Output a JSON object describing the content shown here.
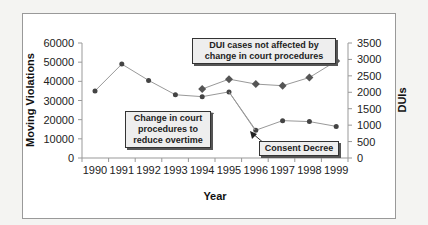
{
  "chart_data": {
    "type": "line",
    "title": "",
    "xlabel": "Year",
    "ylabel": "Moving Violations",
    "y2label": "DUIs",
    "categories": [
      "1990",
      "1991",
      "1992",
      "1993",
      "1994",
      "1995",
      "1996",
      "1997",
      "1998",
      "1999"
    ],
    "ylim": [
      0,
      60000
    ],
    "yticks": [
      "0",
      "10000",
      "20000",
      "30000",
      "40000",
      "50000",
      "60000"
    ],
    "y2lim": [
      0,
      3500
    ],
    "y2ticks": [
      "0",
      "500",
      "1000",
      "1500",
      "2000",
      "2500",
      "3000",
      "3500"
    ],
    "series": [
      {
        "name": "Moving Violations",
        "axis": "left",
        "marker": "circle",
        "values": [
          35000,
          49000,
          40500,
          33000,
          32000,
          34500,
          14500,
          19500,
          19000,
          16500
        ]
      },
      {
        "name": "DUIs",
        "axis": "right",
        "marker": "diamond",
        "values": [
          null,
          null,
          null,
          null,
          2100,
          2400,
          2250,
          2200,
          2450,
          2950
        ]
      }
    ],
    "annotations": [
      {
        "id": "dui",
        "text": "DUI cases not affected by change in court procedures"
      },
      {
        "id": "court",
        "text": "Change in court procedures to reduce overtime"
      },
      {
        "id": "consent",
        "text": "Consent Decree"
      }
    ],
    "grid": false,
    "legend": "none"
  }
}
